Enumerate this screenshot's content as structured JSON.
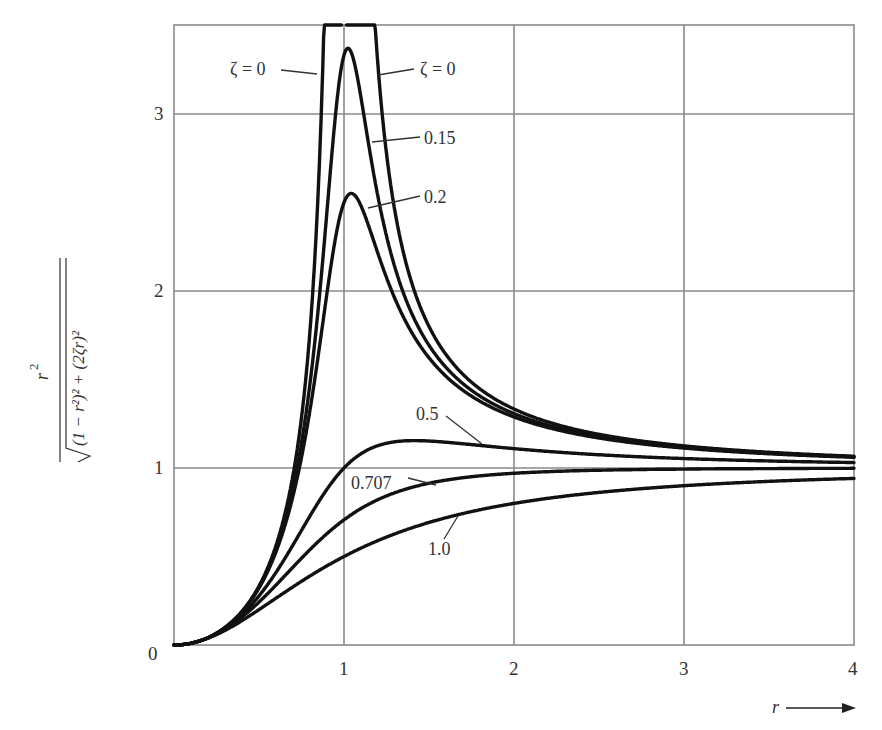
{
  "chart_data": {
    "type": "line",
    "title": "",
    "xlabel": "r",
    "ylabel": "r^2 / sqrt((1 - r^2)^2 + (2ζr)^2)",
    "ylabel_numerator": "r",
    "ylabel_denominator": "(1 − r²)² + (2ζr)²",
    "xlim": [
      0,
      4
    ],
    "ylim": [
      0,
      3.5
    ],
    "grid": true,
    "x_ticks": [
      "0",
      "1",
      "2",
      "3",
      "4"
    ],
    "y_ticks": [
      "1",
      "2",
      "3"
    ],
    "origin_label": "0",
    "x_arrow_label": "r",
    "series": [
      {
        "name": "ζ = 0",
        "zeta": 0,
        "label_pos": "left-branch",
        "peak": "infinite"
      },
      {
        "name": "ζ = 0",
        "zeta": 0,
        "label_pos": "right-branch",
        "peak": "infinite"
      },
      {
        "name": "0.15",
        "zeta": 0.15,
        "peak_value": 3.3
      },
      {
        "name": "0.2",
        "zeta": 0.2,
        "peak_value": 2.5
      },
      {
        "name": "0.5",
        "zeta": 0.5,
        "peak_value": 1.15
      },
      {
        "name": "0.707",
        "zeta": 0.707,
        "value_at_r4": 1.0
      },
      {
        "name": "1.0",
        "zeta": 1.0,
        "value_at_r4": 0.94
      }
    ],
    "sample_points": {
      "r": [
        0,
        0.5,
        1.0,
        1.5,
        2.0,
        3.0,
        4.0
      ],
      "zeta_0.15": [
        0,
        0.33,
        3.33,
        1.71,
        1.31,
        1.12,
        1.06
      ],
      "zeta_0.2": [
        0,
        0.33,
        2.5,
        1.66,
        1.29,
        1.11,
        1.06
      ],
      "zeta_0.5": [
        0,
        0.28,
        1.0,
        1.17,
        1.15,
        1.08,
        1.04
      ],
      "zeta_0.707": [
        0,
        0.24,
        0.71,
        0.91,
        0.97,
        0.99,
        1.0
      ],
      "zeta_1.0": [
        0,
        0.2,
        0.5,
        0.69,
        0.8,
        0.9,
        0.94
      ]
    },
    "annotations": [
      "ζ = 0",
      "ζ = 0",
      "0.15",
      "0.2",
      "0.5",
      "0.707",
      "1.0"
    ]
  },
  "labels": {
    "zeta0_left": "ζ = 0",
    "zeta0_right": "ζ = 0",
    "z015": "0.15",
    "z02": "0.2",
    "z05": "0.5",
    "z0707": "0.707",
    "z10": "1.0",
    "tick_x0": "0",
    "tick_x1": "1",
    "tick_x2": "2",
    "tick_x3": "3",
    "tick_x4": "4",
    "tick_y1": "1",
    "tick_y2": "2",
    "tick_y3": "3",
    "x_axis": "r",
    "y_num": "r",
    "y_num_exp": "2",
    "y_den": "(1 − r²)² + (2ζr)²"
  }
}
